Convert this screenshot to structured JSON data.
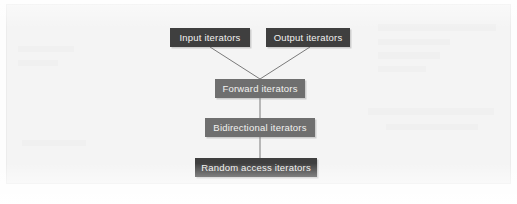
{
  "figure": {
    "background_color": "#f4f4f4",
    "border_color": "#ececec"
  },
  "diagram": {
    "type": "hierarchy",
    "orientation": "top-down",
    "node_fill_dark": "#3f3f3f",
    "node_fill_mid": "#6f6f6f",
    "node_text_color": "#f2f2f0",
    "connector_color": "#7a7a7a",
    "nodes": [
      {
        "id": "input",
        "label": "Input iterators",
        "style": "dark",
        "x": 170,
        "y": 28,
        "w": 80,
        "h": 19,
        "level": 0
      },
      {
        "id": "output",
        "label": "Output iterators",
        "style": "dark",
        "x": 266,
        "y": 28,
        "w": 84,
        "h": 19,
        "level": 0
      },
      {
        "id": "forward",
        "label": "Forward iterators",
        "style": "mid",
        "x": 215,
        "y": 79,
        "w": 90,
        "h": 19,
        "level": 1
      },
      {
        "id": "bidirectional",
        "label": "Bidirectional iterators",
        "style": "mid",
        "x": 205,
        "y": 118,
        "w": 110,
        "h": 19,
        "level": 2
      },
      {
        "id": "random",
        "label": "Random access iterators",
        "style": "dark",
        "x": 195,
        "y": 158,
        "w": 122,
        "h": 19,
        "level": 3
      }
    ],
    "edges": [
      {
        "id": "input-to-forward",
        "from": "input",
        "to": "forward",
        "kind": "diagonal"
      },
      {
        "id": "output-to-forward",
        "from": "output",
        "to": "forward",
        "kind": "diagonal"
      },
      {
        "id": "forward-to-bidirectional",
        "from": "forward",
        "to": "bidirectional",
        "kind": "vertical"
      },
      {
        "id": "bidirectional-to-random",
        "from": "bidirectional",
        "to": "random",
        "kind": "vertical"
      }
    ]
  }
}
